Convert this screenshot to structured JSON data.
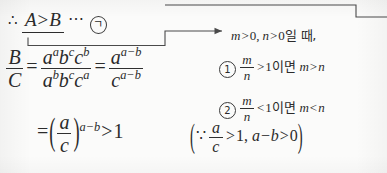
{
  "page": {
    "type": "math-solution-scan",
    "language": "ko",
    "background_color": "#fbfbfa",
    "ink_color": "#2b2b2b"
  },
  "conclusion_line": {
    "therefore_symbol": "∴",
    "underlined_expr": {
      "left": "A",
      "relation": ">",
      "right": "B"
    },
    "dots": "⋯",
    "label": "ㄱ",
    "label_circled": "㉠"
  },
  "main_derivation": {
    "lhs": {
      "numerator": "B",
      "denominator": "C"
    },
    "equals": "=",
    "expanded": {
      "numerator": [
        {
          "base": "a",
          "exp": "a"
        },
        {
          "base": "b",
          "exp": "c"
        },
        {
          "base": "c",
          "exp": "b"
        }
      ],
      "denominator": [
        {
          "base": "a",
          "exp": "b"
        },
        {
          "base": "b",
          "exp": "c"
        },
        {
          "base": "c",
          "exp": "a"
        }
      ]
    },
    "equals2": "=",
    "simplified": {
      "numerator": {
        "base": "a",
        "exp": "a−b"
      },
      "denominator": {
        "base": "c",
        "exp": "a−b"
      }
    }
  },
  "final_line": {
    "equals": "=",
    "power": {
      "base_numerator": "a",
      "base_denominator": "c",
      "exponent": "a−b"
    },
    "relation": ">",
    "value": "1",
    "because_symbol": "∵",
    "reason_frac_num": "a",
    "reason_frac_den": "c",
    "reason_rel_1": ">",
    "reason_val_1": "1",
    "reason_sep": ",",
    "reason_expr_2": "a−b",
    "reason_rel_2": ">",
    "reason_val_2": "0"
  },
  "side_note": {
    "condition": {
      "m_expr": "m",
      "m_rel": ">",
      "m_val": "0",
      "comma": ",",
      "n_expr": "n",
      "n_rel": ">",
      "n_val": "0",
      "korean_tail": "일 때,"
    },
    "cases": [
      {
        "marker": "①",
        "frac_num": "m",
        "frac_den": "n",
        "relation": ">",
        "threshold": "1",
        "korean_if": "이면",
        "result_left": "m",
        "result_rel": ">",
        "result_right": "n"
      },
      {
        "marker": "②",
        "frac_num": "m",
        "frac_den": "n",
        "relation": "<",
        "threshold": "1",
        "korean_if": "이면",
        "result_left": "m",
        "result_rel": "<",
        "result_right": "n"
      }
    ]
  },
  "annotations": {
    "connector_from_conclusion_to_note": "elbow-arrow",
    "connector_from_note_bracket": "elbow-line",
    "arrow_head": "▶"
  }
}
